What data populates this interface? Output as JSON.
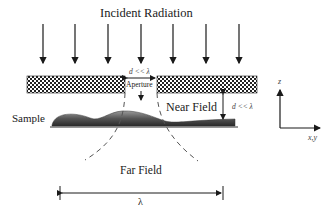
{
  "diagram": {
    "title": "Incident Radiation",
    "labels": {
      "aperture": "Aperture",
      "near_field": "Near Field",
      "far_field": "Far Field",
      "sample": "Sample",
      "wavelength": "λ",
      "aperture_size": "d << λ",
      "tip_sample_distance": "d << λ"
    },
    "axes": {
      "vertical": "z",
      "horizontal": "x,y"
    },
    "incident_arrow_count": 7,
    "colors": {
      "line": "#1a1a1a",
      "screen_pattern": "#2a2a2a",
      "sample_fill": "#6a6a6a",
      "dashed_curve": "#555555"
    }
  }
}
